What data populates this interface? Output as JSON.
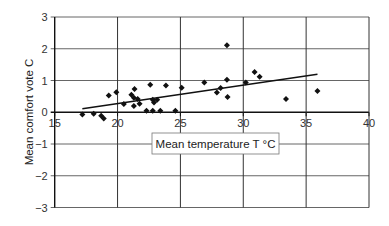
{
  "chart_data": {
    "type": "scatter",
    "title": "",
    "xlabel": "Mean temperature T °C",
    "ylabel": "Mean comfort vote C",
    "xlim": [
      15,
      40
    ],
    "ylim": [
      -3,
      3
    ],
    "xticks": [
      15,
      20,
      25,
      30,
      35,
      40
    ],
    "yticks": [
      -3,
      -2,
      -1,
      0,
      1,
      2,
      3
    ],
    "xtick_labels": [
      "15",
      "20",
      "25",
      "30",
      "35",
      "40"
    ],
    "ytick_labels": [
      "−3",
      "−2",
      "−1",
      "0",
      "1",
      "2",
      "3"
    ],
    "grid": true,
    "legend": "none",
    "marker": "diamond",
    "series": [
      {
        "name": "observations",
        "points": [
          [
            17.2,
            -0.07
          ],
          [
            18.1,
            -0.05
          ],
          [
            18.7,
            -0.11
          ],
          [
            18.9,
            -0.2
          ],
          [
            19.3,
            0.53
          ],
          [
            19.9,
            0.63
          ],
          [
            20.5,
            0.26
          ],
          [
            21.1,
            0.55
          ],
          [
            21.3,
            0.46
          ],
          [
            21.35,
            0.73
          ],
          [
            21.3,
            0.2
          ],
          [
            21.6,
            0.42
          ],
          [
            21.75,
            0.27
          ],
          [
            22.6,
            0.87
          ],
          [
            22.3,
            0.05
          ],
          [
            22.8,
            0.05
          ],
          [
            23.4,
            0.05
          ],
          [
            24.6,
            0.05
          ],
          [
            22.8,
            0.39
          ],
          [
            23.15,
            0.39
          ],
          [
            22.9,
            0.31
          ],
          [
            23.85,
            0.84
          ],
          [
            25.1,
            0.77
          ],
          [
            26.9,
            0.94
          ],
          [
            27.9,
            0.62
          ],
          [
            28.2,
            0.76
          ],
          [
            28.7,
            2.11
          ],
          [
            28.7,
            1.02
          ],
          [
            28.75,
            0.48
          ],
          [
            30.2,
            0.94
          ],
          [
            30.9,
            1.27
          ],
          [
            31.3,
            1.12
          ],
          [
            33.4,
            0.42
          ],
          [
            35.9,
            0.67
          ]
        ]
      }
    ],
    "trendline": {
      "type": "linear",
      "x": [
        17.2,
        35.9
      ],
      "y": [
        0.11,
        1.2
      ]
    }
  }
}
